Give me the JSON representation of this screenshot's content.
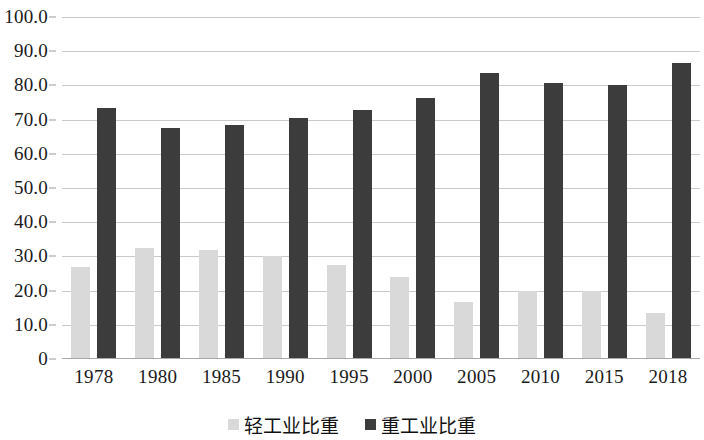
{
  "chart_data": {
    "type": "bar",
    "title": "",
    "subtitle": "",
    "xlabel": "",
    "ylabel": "",
    "grid": true,
    "legend_position": "bottom",
    "ylim": [
      0,
      100
    ],
    "ytick_labels": [
      "100.0",
      "90.0",
      "80.0",
      "70.0",
      "60.0",
      "50.0",
      "40.0",
      "30.0",
      "20.0",
      "10.0",
      "0"
    ],
    "ytick_values": [
      100,
      90,
      80,
      70,
      60,
      50,
      40,
      30,
      20,
      10,
      0
    ],
    "categories": [
      "1978",
      "1980",
      "1985",
      "1990",
      "1995",
      "2000",
      "2005",
      "2010",
      "2015",
      "2018"
    ],
    "series": [
      {
        "name": "轻工业比重",
        "color": "#d9d9d9",
        "values": [
          26.8,
          32.4,
          31.8,
          30.1,
          27.4,
          23.9,
          16.8,
          20.0,
          20.0,
          13.4
        ]
      },
      {
        "name": "重工业比重",
        "color": "#3c3c3c",
        "values": [
          73.4,
          67.6,
          68.4,
          70.5,
          72.7,
          76.3,
          83.5,
          80.8,
          80.2,
          86.6
        ]
      }
    ]
  },
  "legend": {
    "items": [
      {
        "label": "轻工业比重",
        "swatch": "light"
      },
      {
        "label": "重工业比重",
        "swatch": "dark"
      }
    ]
  }
}
